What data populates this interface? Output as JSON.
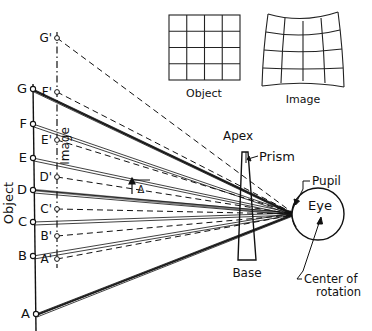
{
  "figure": {
    "title_implicit": "Prism ray diagram: object, image displacement and distortion",
    "axis_labels": {
      "object_axis": "Object",
      "image_axis": "Image"
    },
    "annotations": {
      "apex": "Apex",
      "prism": "Prism",
      "base": "Base",
      "pupil": "Pupil",
      "eye": "Eye",
      "center_of_rotation": "Center of rotation",
      "deviation_symbol": "Δ"
    },
    "inset_grids": [
      {
        "name": "object-grid",
        "label": "Object",
        "rows": 4,
        "cols": 4,
        "distortion": "none"
      },
      {
        "name": "image-grid",
        "label": "Image",
        "rows": 4,
        "cols": 4,
        "distortion": "pincushion"
      }
    ],
    "object_points": [
      {
        "label": "G",
        "x": 33,
        "y": 89
      },
      {
        "label": "F",
        "x": 33,
        "y": 124
      },
      {
        "label": "E",
        "x": 33,
        "y": 158
      },
      {
        "label": "D",
        "x": 33,
        "y": 190
      },
      {
        "label": "C",
        "x": 33,
        "y": 222
      },
      {
        "label": "B",
        "x": 33,
        "y": 256
      },
      {
        "label": "A",
        "x": 36,
        "y": 314
      }
    ],
    "image_points": [
      {
        "label": "G'",
        "x": 57,
        "y": 38
      },
      {
        "label": "F'",
        "x": 57,
        "y": 92
      },
      {
        "label": "E'",
        "x": 57,
        "y": 140
      },
      {
        "label": "D'",
        "x": 57,
        "y": 177
      },
      {
        "label": "C'",
        "x": 57,
        "y": 209
      },
      {
        "label": "B'",
        "x": 57,
        "y": 236
      },
      {
        "label": "A'",
        "x": 57,
        "y": 259
      }
    ],
    "pupil_point": {
      "x": 293,
      "y": 214
    },
    "eye": {
      "cx": 318,
      "cy": 214,
      "r": 26
    },
    "prism": {
      "apex_left_x": 242,
      "apex_right_x": 248,
      "apex_y": 152,
      "base_left_x": 238,
      "base_right_x": 256,
      "base_y": 260
    },
    "colors": {
      "ink": "#111111",
      "paper": "#ffffff"
    }
  }
}
